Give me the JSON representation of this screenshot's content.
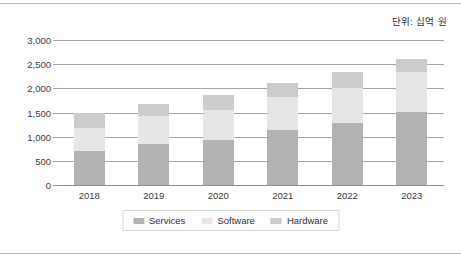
{
  "unit_note": "단위: 십억 원",
  "chart_data": {
    "type": "bar",
    "subtype": "stacked-vertical",
    "title": "",
    "subtitle": "",
    "xlabel": "",
    "ylabel": "",
    "unit_note": "단위: 십억 원",
    "categories": [
      "2018",
      "2019",
      "2020",
      "2021",
      "2022",
      "2023"
    ],
    "series": [
      {
        "name": "Services",
        "color": "#b3b3b3",
        "values": [
          700,
          840,
          940,
          1130,
          1280,
          1510
        ]
      },
      {
        "name": "Software",
        "color": "#e6e6e6",
        "values": [
          480,
          590,
          610,
          700,
          730,
          830
        ]
      },
      {
        "name": "Hardware",
        "color": "#cccccc",
        "values": [
          320,
          250,
          320,
          280,
          320,
          270
        ]
      }
    ],
    "totals": [
      1500,
      1680,
      1870,
      2110,
      2330,
      2610
    ],
    "ylim": [
      0,
      3000
    ],
    "ytick_step": 500,
    "ytick_labels": [
      "0",
      "500",
      "1,000",
      "1,500",
      "2,000",
      "2,500",
      "3,000"
    ],
    "ytick_values": [
      0,
      500,
      1000,
      1500,
      2000,
      2500,
      3000
    ],
    "grid": true,
    "grid_axis": "y",
    "legend": {
      "position": "bottom",
      "entries": [
        {
          "label": "Services",
          "color": "#b3b3b3"
        },
        {
          "label": "Software",
          "color": "#e6e6e6"
        },
        {
          "label": "Hardware",
          "color": "#cccccc"
        }
      ]
    }
  }
}
